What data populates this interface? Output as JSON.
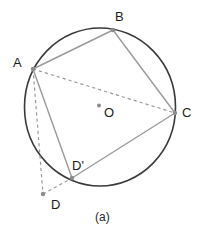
{
  "figure": {
    "caption": "(a)",
    "colors": {
      "circle_stroke": "#3a3a3a",
      "chord_stroke": "#9a9a9a",
      "dashed_stroke": "#9a9a9a",
      "point_marker": "#8c8c8c",
      "label_text": "#1c1c1c",
      "background": "#ffffff"
    },
    "circle": {
      "name": "circumscribed-circle",
      "cx": 100,
      "cy": 107,
      "rx": 75.5,
      "ry": 79,
      "stroke_width": 1.6
    },
    "center_point": {
      "label": "O",
      "x": 99,
      "y": 105.5,
      "label_x": 104,
      "label_y": 106
    },
    "points": [
      {
        "id": "A",
        "label": "A",
        "x": 33,
        "y": 69,
        "label_x": 13,
        "label_y": 56,
        "on_circle": true
      },
      {
        "id": "B",
        "label": "B",
        "x": 113,
        "y": 30,
        "label_x": 115,
        "label_y": 10,
        "on_circle": true
      },
      {
        "id": "C",
        "label": "C",
        "x": 175,
        "y": 113,
        "label_x": 182,
        "label_y": 106,
        "on_circle": true
      },
      {
        "id": "Dp",
        "label": "D'",
        "x": 72,
        "y": 178,
        "label_x": 72,
        "label_y": 159,
        "on_circle": true
      },
      {
        "id": "D",
        "label": "D",
        "x": 43,
        "y": 194,
        "label_x": 51,
        "label_y": 198,
        "on_circle": false
      }
    ],
    "solid_edges": [
      {
        "name": "edge-A-B",
        "from": "A",
        "to": "B"
      },
      {
        "name": "edge-B-C",
        "from": "B",
        "to": "C"
      },
      {
        "name": "edge-C-Dp",
        "from": "C",
        "to": "Dp"
      },
      {
        "name": "edge-A-Dp",
        "from": "A",
        "to": "Dp"
      }
    ],
    "dashed_edges": [
      {
        "name": "diagonal-A-C",
        "from": "A",
        "to": "C"
      },
      {
        "name": "segment-A-D",
        "from": "A",
        "to": "D"
      },
      {
        "name": "segment-D-Dp",
        "from": "D",
        "to": "Dp"
      }
    ]
  }
}
